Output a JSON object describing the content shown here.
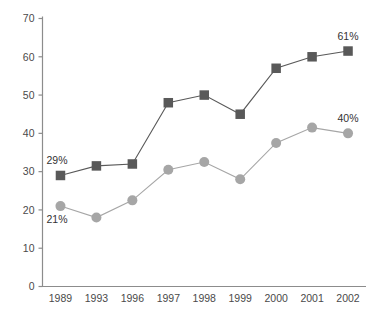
{
  "chart_data": {
    "type": "line",
    "title": "",
    "subtitle": "",
    "xlabel": "",
    "ylabel": "",
    "categories": [
      "1989",
      "1993",
      "1996",
      "1997",
      "1998",
      "1999",
      "2000",
      "2001",
      "2002"
    ],
    "series": [
      {
        "name": "series-squares",
        "marker": "square",
        "color": "#595959",
        "values": [
          29,
          31.5,
          32,
          48,
          50,
          45,
          57,
          60,
          61.5
        ]
      },
      {
        "name": "series-circles",
        "marker": "circle",
        "color": "#a6a6a6",
        "values": [
          21,
          18,
          22.5,
          30.5,
          32.5,
          28,
          37.5,
          41.5,
          40
        ]
      }
    ],
    "ylim": [
      0,
      70
    ],
    "yticks": [
      0,
      10,
      20,
      30,
      40,
      50,
      60,
      70
    ],
    "ytick_labels": [
      "0",
      "10",
      "20",
      "30",
      "40",
      "50",
      "60",
      "70"
    ],
    "grid": false,
    "legend": "none",
    "annotations": [
      {
        "text": "29%",
        "series": "series-squares",
        "category": "1989",
        "position": "above-left"
      },
      {
        "text": "21%",
        "series": "series-circles",
        "category": "1989",
        "position": "below-left"
      },
      {
        "text": "61%",
        "series": "series-squares",
        "category": "2002",
        "position": "above"
      },
      {
        "text": "40%",
        "series": "series-circles",
        "category": "2002",
        "position": "above"
      }
    ]
  },
  "colors": {
    "series_squares": "#595959",
    "series_circles": "#a6a6a6",
    "axis": "#8c8c8c",
    "tick_text": "#4a4a4a",
    "label_text": "#333333",
    "background": "#ffffff"
  }
}
